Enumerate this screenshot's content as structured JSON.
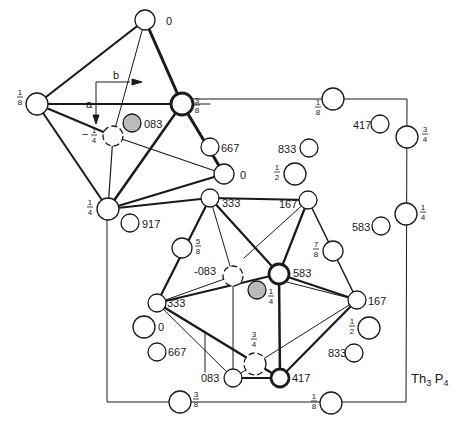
{
  "title": "Th3 P4",
  "title_main": "Th",
  "title_sub1": "3",
  "title_mid": " P",
  "title_sub2": "4",
  "axes": {
    "a": "a",
    "b": "b"
  },
  "colors": {
    "line": "#1a1a1a",
    "background": "#ffffff",
    "shade": "#9a9a9a"
  },
  "unit_cell": {
    "x": 107,
    "y": 99,
    "width": 300,
    "height": 303
  },
  "atoms": [
    {
      "id": "oct-top",
      "label": "0",
      "x": 145,
      "y": 20,
      "r": 10,
      "label_x": 166,
      "label_y": 25
    },
    {
      "id": "oct-left",
      "label": "1/8",
      "num": "1",
      "den": "8",
      "x": 37,
      "y": 104,
      "r": 11,
      "frac_x": 20,
      "frac_y": 96
    },
    {
      "id": "oct-right",
      "label": "3/8",
      "num": "3",
      "den": "8",
      "x": 182,
      "y": 104,
      "r": 11,
      "frac_x": 197,
      "frac_y": 104
    },
    {
      "id": "oct-bottom",
      "label": "1/4",
      "num": "1",
      "den": "4",
      "x": 108,
      "y": 209,
      "r": 11,
      "frac_x": 90,
      "frac_y": 206
    },
    {
      "id": "oct-back",
      "label": "-1/4",
      "num": "1",
      "den": "4",
      "x": 113,
      "y": 136,
      "r": 10,
      "frac_x": 94,
      "frac_y": 134
    },
    {
      "id": "oct-right-low",
      "label": "0",
      "x": 224,
      "y": 174,
      "r": 10,
      "label_x": 240,
      "label_y": 179
    },
    {
      "id": "shaded-083",
      "label": "083",
      "x": 132,
      "y": 123,
      "r": 9,
      "label_x": 144,
      "label_y": 128
    },
    {
      "id": "top-cell",
      "label": "1/8",
      "num": "1",
      "den": "8",
      "x": 333,
      "y": 99,
      "r": 11,
      "frac_x": 318,
      "frac_y": 106
    },
    {
      "id": "free-417",
      "label": "417",
      "x": 380,
      "y": 124,
      "r": 9,
      "label_x": 353,
      "label_y": 129
    },
    {
      "id": "edge-3-4",
      "label": "3/4",
      "num": "3",
      "den": "4",
      "x": 407,
      "y": 137,
      "r": 11,
      "frac_x": 425,
      "frac_y": 133
    },
    {
      "id": "free-667",
      "label": "667",
      "x": 210,
      "y": 147,
      "r": 9,
      "label_x": 221,
      "label_y": 152
    },
    {
      "id": "free-833a",
      "label": "833",
      "x": 309,
      "y": 148,
      "r": 9,
      "label_x": 278,
      "label_y": 153
    },
    {
      "id": "free-half-a",
      "label": "1/2",
      "num": "1",
      "den": "2",
      "x": 295,
      "y": 174,
      "r": 11,
      "frac_x": 277,
      "frac_y": 171
    },
    {
      "id": "edge-1-4",
      "label": "1/4",
      "num": "1",
      "den": "4",
      "x": 406,
      "y": 214,
      "r": 11,
      "frac_x": 423,
      "frac_y": 211
    },
    {
      "id": "free-583",
      "label": "583",
      "x": 381,
      "y": 226,
      "r": 9,
      "label_x": 352,
      "label_y": 231
    },
    {
      "id": "free-917",
      "label": "917",
      "x": 130,
      "y": 223,
      "r": 9,
      "label_x": 142,
      "label_y": 228
    },
    {
      "id": "poly-333-top",
      "label": "333",
      "x": 210,
      "y": 198,
      "r": 9,
      "label_x": 222,
      "label_y": 207
    },
    {
      "id": "poly-167-top",
      "label": "167",
      "x": 308,
      "y": 200,
      "r": 9,
      "label_x": 279,
      "label_y": 208
    },
    {
      "id": "free-5-8",
      "label": "5/8",
      "num": "5",
      "den": "8",
      "x": 182,
      "y": 248,
      "r": 10,
      "frac_x": 198,
      "frac_y": 245
    },
    {
      "id": "free-7-8",
      "label": "7/8",
      "num": "7",
      "den": "8",
      "x": 333,
      "y": 251,
      "r": 10,
      "frac_x": 316,
      "frac_y": 248
    },
    {
      "id": "poly-minus-083",
      "label": "-083",
      "x": 233,
      "y": 276,
      "r": 10,
      "label_x": 194,
      "label_y": 275
    },
    {
      "id": "poly-583",
      "label": "583",
      "x": 279,
      "y": 274,
      "r": 10,
      "label_x": 293,
      "label_y": 277
    },
    {
      "id": "shaded-1-4",
      "label": "1/4",
      "num": "1",
      "den": "4",
      "x": 257,
      "y": 290,
      "r": 9,
      "frac_x": 271,
      "frac_y": 295
    },
    {
      "id": "poly-333-left",
      "label": "333",
      "x": 157,
      "y": 303,
      "r": 9,
      "label_x": 167,
      "label_y": 307
    },
    {
      "id": "poly-167-right",
      "label": "167",
      "x": 357,
      "y": 300,
      "r": 9,
      "label_x": 368,
      "label_y": 305
    },
    {
      "id": "free-0",
      "label": "0",
      "x": 144,
      "y": 327,
      "r": 11,
      "label_x": 158,
      "label_y": 331
    },
    {
      "id": "free-half-b",
      "label": "1/2",
      "num": "1",
      "den": "2",
      "x": 369,
      "y": 328,
      "r": 11,
      "frac_x": 352,
      "frac_y": 325
    },
    {
      "id": "free-667b",
      "label": "667",
      "x": 157,
      "y": 352,
      "r": 9,
      "label_x": 168,
      "label_y": 356
    },
    {
      "id": "free-833b",
      "label": "833",
      "x": 354,
      "y": 353,
      "r": 9,
      "label_x": 328,
      "label_y": 357
    },
    {
      "id": "poly-3-4",
      "label": "3/4",
      "num": "3",
      "den": "4",
      "x": 255,
      "y": 364,
      "r": 11,
      "frac_x": 254,
      "frac_y": 338
    },
    {
      "id": "poly-083",
      "label": "083",
      "x": 233,
      "y": 378,
      "r": 9,
      "label_x": 201,
      "label_y": 382
    },
    {
      "id": "poly-417",
      "label": "417",
      "x": 280,
      "y": 378,
      "r": 9,
      "label_x": 292,
      "label_y": 382
    },
    {
      "id": "bottom-3-8",
      "label": "3/8",
      "num": "3",
      "den": "8",
      "x": 180,
      "y": 402,
      "r": 11,
      "frac_x": 196,
      "frac_y": 398
    },
    {
      "id": "bottom-1-8",
      "label": "1/8",
      "num": "1",
      "den": "8",
      "x": 331,
      "y": 403,
      "r": 11,
      "frac_x": 314,
      "frac_y": 400
    }
  ]
}
